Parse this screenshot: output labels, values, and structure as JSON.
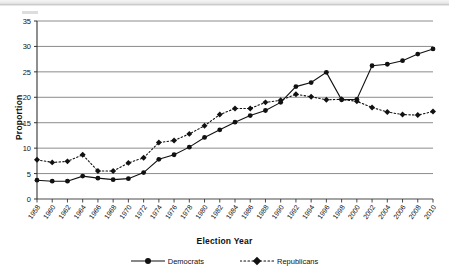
{
  "chart_data": {
    "type": "line",
    "title": "",
    "xlabel": "Election Year",
    "ylabel": "Proportion",
    "xlim": [
      1958,
      2010
    ],
    "ylim": [
      0,
      35
    ],
    "ytick_step": 5,
    "grid": "horizontal",
    "legend_position": "bottom",
    "categories": [
      "1958",
      "1960",
      "1962",
      "1964",
      "1966",
      "1968",
      "1970",
      "1972",
      "1974",
      "1976",
      "1978",
      "1980",
      "1982",
      "1984",
      "1986",
      "1988",
      "1990",
      "1992",
      "1994",
      "1996",
      "1998",
      "2000",
      "2002",
      "2004",
      "2006",
      "2008",
      "2010"
    ],
    "yticks": [
      "0",
      "5",
      "10",
      "15",
      "20",
      "25",
      "30",
      "35"
    ],
    "series": [
      {
        "name": "Democrats",
        "style": "solid",
        "marker": "circle",
        "color": "#111111",
        "values": [
          3.7,
          3.5,
          3.5,
          4.5,
          4.1,
          3.8,
          4.0,
          5.2,
          7.8,
          8.7,
          10.2,
          12.1,
          13.6,
          15.1,
          16.4,
          17.4,
          19.0,
          22.1,
          22.9,
          24.9,
          19.5,
          19.6,
          26.2,
          26.5,
          27.2,
          28.5,
          29.5
        ]
      },
      {
        "name": "Republicans",
        "style": "dotted",
        "marker": "diamond",
        "color": "#111111",
        "values": [
          7.7,
          7.2,
          7.4,
          8.7,
          5.5,
          5.5,
          7.1,
          8.1,
          11.1,
          11.5,
          12.8,
          14.4,
          16.6,
          17.8,
          17.8,
          19.0,
          19.4,
          20.6,
          20.1,
          19.5,
          19.6,
          19.2,
          18.0,
          17.1,
          16.6,
          16.5,
          17.2
        ]
      }
    ],
    "series_democrats_full": [
      3.7,
      3.5,
      3.5,
      4.5,
      4.1,
      3.8,
      4.0,
      5.2,
      7.8,
      8.7,
      10.2,
      12.1,
      13.6,
      15.1,
      16.4,
      17.4,
      19.0,
      19.2,
      22.1,
      22.9,
      24.9,
      26.2,
      26.5,
      27.2,
      28.5,
      29.5,
      31.3,
      31.5
    ]
  },
  "legend": {
    "entries": [
      {
        "label": "Democrats"
      },
      {
        "label": "Republicans"
      }
    ]
  },
  "axes": {
    "x_title": "Election Year",
    "y_title": "Proportion"
  }
}
